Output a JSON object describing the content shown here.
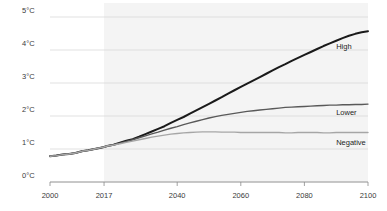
{
  "chart_data": {
    "type": "line",
    "title": "",
    "xlabel": "",
    "ylabel": "Temperature change",
    "xlim": [
      2000,
      2100
    ],
    "ylim": [
      0,
      5
    ],
    "grid": true,
    "legend_position": "right-inline",
    "shaded_region": {
      "from": 2017,
      "to": 2100,
      "color": "#f4f4f4"
    },
    "yticks": [
      "0°C",
      "1°C",
      "2°C",
      "3°C",
      "4°C",
      "5°C"
    ],
    "ytick_values": [
      0,
      1,
      2,
      3,
      4,
      5
    ],
    "xticks": [
      "2000",
      "2017",
      "2040",
      "2060",
      "2080",
      "2100"
    ],
    "xtick_values": [
      2000,
      2017,
      2040,
      2060,
      2080,
      2100
    ],
    "x": [
      2000,
      2002,
      2004,
      2006,
      2008,
      2010,
      2012,
      2014,
      2016,
      2017,
      2018,
      2020,
      2022,
      2024,
      2026,
      2028,
      2030,
      2032,
      2034,
      2036,
      2038,
      2040,
      2042,
      2044,
      2046,
      2048,
      2050,
      2052,
      2054,
      2056,
      2058,
      2060,
      2062,
      2064,
      2066,
      2068,
      2070,
      2072,
      2074,
      2076,
      2078,
      2080,
      2082,
      2084,
      2086,
      2088,
      2090,
      2092,
      2094,
      2096,
      2098,
      2100
    ],
    "series": [
      {
        "name": "High",
        "color": "#1a1a1a",
        "width": 2.0,
        "label_x": 2090,
        "label_y": 4.1,
        "values": [
          0.78,
          0.8,
          0.83,
          0.85,
          0.88,
          0.93,
          0.96,
          1.0,
          1.04,
          1.06,
          1.09,
          1.13,
          1.19,
          1.25,
          1.3,
          1.37,
          1.45,
          1.53,
          1.61,
          1.69,
          1.79,
          1.88,
          1.97,
          2.07,
          2.17,
          2.27,
          2.37,
          2.47,
          2.57,
          2.68,
          2.78,
          2.88,
          2.98,
          3.08,
          3.18,
          3.28,
          3.38,
          3.48,
          3.57,
          3.67,
          3.76,
          3.85,
          3.94,
          4.03,
          4.12,
          4.2,
          4.28,
          4.36,
          4.43,
          4.49,
          4.54,
          4.57
        ]
      },
      {
        "name": "Lower",
        "color": "#595959",
        "width": 1.4,
        "label_x": 2090,
        "label_y": 2.08,
        "values": [
          0.78,
          0.8,
          0.83,
          0.85,
          0.88,
          0.93,
          0.96,
          1.0,
          1.04,
          1.06,
          1.09,
          1.13,
          1.18,
          1.23,
          1.28,
          1.34,
          1.4,
          1.46,
          1.51,
          1.57,
          1.63,
          1.68,
          1.74,
          1.79,
          1.84,
          1.89,
          1.94,
          1.98,
          2.02,
          2.05,
          2.08,
          2.11,
          2.14,
          2.16,
          2.18,
          2.2,
          2.22,
          2.24,
          2.26,
          2.27,
          2.28,
          2.29,
          2.3,
          2.31,
          2.32,
          2.33,
          2.33,
          2.34,
          2.34,
          2.35,
          2.35,
          2.36
        ]
      },
      {
        "name": "Negative",
        "color": "#a6a6a6",
        "width": 1.4,
        "label_x": 2090,
        "label_y": 1.18,
        "values": [
          0.78,
          0.8,
          0.83,
          0.85,
          0.88,
          0.93,
          0.96,
          1.0,
          1.04,
          1.06,
          1.09,
          1.12,
          1.16,
          1.2,
          1.24,
          1.28,
          1.32,
          1.36,
          1.39,
          1.42,
          1.45,
          1.47,
          1.49,
          1.5,
          1.51,
          1.52,
          1.52,
          1.52,
          1.51,
          1.51,
          1.51,
          1.5,
          1.5,
          1.5,
          1.5,
          1.5,
          1.5,
          1.5,
          1.49,
          1.49,
          1.5,
          1.5,
          1.5,
          1.5,
          1.49,
          1.49,
          1.5,
          1.5,
          1.5,
          1.5,
          1.5,
          1.5
        ]
      }
    ]
  },
  "colors": {
    "background": "#ffffff",
    "gridline": "#d4d4d4",
    "axis": "#8a8a8a",
    "shade": "#f3f3f3",
    "text": "#2b2b2b"
  }
}
